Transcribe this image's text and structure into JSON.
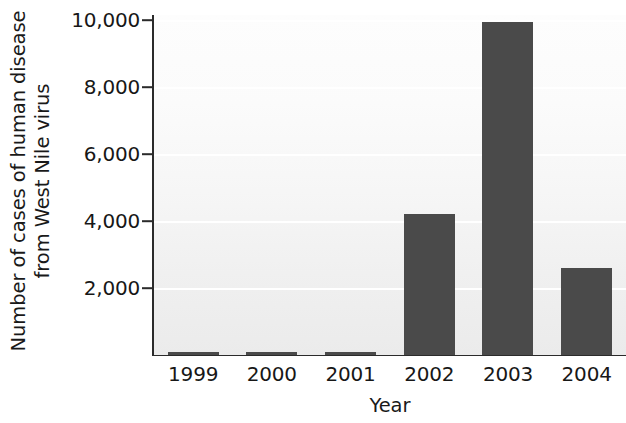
{
  "chart_data": {
    "type": "bar",
    "title": "",
    "subtitle": "",
    "xlabel": "Year",
    "ylabel": "Number of cases of human disease from West Nile virus",
    "ylabel_lines": [
      "Number of cases of human disease",
      "from West Nile virus"
    ],
    "categories": [
      "1999",
      "2000",
      "2001",
      "2002",
      "2003",
      "2004"
    ],
    "values": [
      62,
      21,
      66,
      4200,
      9950,
      2600
    ],
    "series": [
      {
        "name": "Human cases of West Nile virus",
        "values": [
          62,
          21,
          66,
          4200,
          9950,
          2600
        ]
      }
    ],
    "ylim": [
      0,
      10150
    ],
    "xlim_note": "categorical axis, six year categories",
    "ytick_values": [
      2000,
      4000,
      6000,
      8000,
      10000
    ],
    "ytick_labels": [
      "2,000",
      "4,000",
      "6,000",
      "8,000",
      "10,000"
    ],
    "xtick_labels": [
      "1999",
      "2000",
      "2001",
      "2002",
      "2003",
      "2004"
    ],
    "grid": "horizontal white gridlines at each y tick",
    "legend": "none",
    "legend_position": "none",
    "annotations": [],
    "colors": {
      "bar": "#4a4a4a",
      "plot_background_top": "#fdfdfd",
      "plot_background_bottom": "#ebebeb",
      "gridline": "#ffffff",
      "axis": "#2b2b2b",
      "text": "#171717",
      "page_background": "#ffffff"
    }
  }
}
